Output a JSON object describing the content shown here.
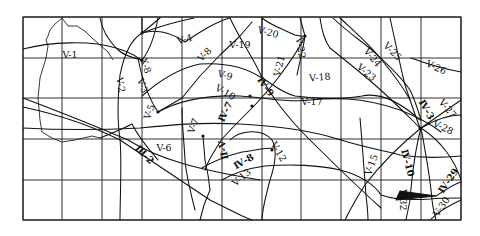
{
  "map": {
    "frame": {
      "x0": 23,
      "y0": 17,
      "x1": 461,
      "y1": 220
    },
    "grid": {
      "vertical_x": [
        23,
        62,
        102,
        142,
        182,
        222,
        262,
        301,
        341,
        381,
        421,
        461
      ],
      "horizontal_y": [
        17,
        58,
        98,
        139,
        180,
        220
      ]
    },
    "colors": {
      "ink": "#111111",
      "background": "#ffffff"
    },
    "labels": [
      {
        "id": "V-1",
        "text": "V-1",
        "x": 70,
        "y": 55,
        "rot": 0
      },
      {
        "id": "V-2",
        "text": "V-2",
        "x": 120,
        "y": 85,
        "rot": 80
      },
      {
        "id": "V-3",
        "text": "V-3",
        "x": 142,
        "y": 86,
        "rot": 70
      },
      {
        "id": "X-8",
        "text": "X-8",
        "x": 145,
        "y": 66,
        "rot": 70
      },
      {
        "id": "V-5",
        "text": "V-5",
        "x": 150,
        "y": 112,
        "rot": -70
      },
      {
        "id": "V-4",
        "text": "V-4",
        "x": 185,
        "y": 40,
        "rot": -15
      },
      {
        "id": "V-8",
        "text": "V-8",
        "x": 205,
        "y": 55,
        "rot": -45
      },
      {
        "id": "V-19",
        "text": "V-19",
        "x": 240,
        "y": 45,
        "rot": 0
      },
      {
        "id": "V-20",
        "text": "V-20",
        "x": 268,
        "y": 33,
        "rot": 15
      },
      {
        "id": "V-22",
        "text": "V-22",
        "x": 300,
        "y": 48,
        "rot": 80
      },
      {
        "id": "V-21",
        "text": "V-21",
        "x": 280,
        "y": 66,
        "rot": -75
      },
      {
        "id": "V-9",
        "text": "V-9",
        "x": 225,
        "y": 76,
        "rot": 15
      },
      {
        "id": "IV-9",
        "text": "Ⅳ-9",
        "x": 265,
        "y": 87,
        "rot": 55
      },
      {
        "id": "V-10",
        "text": "V-10",
        "x": 225,
        "y": 93,
        "rot": 30
      },
      {
        "id": "IV-7",
        "text": "Ⅳ-7",
        "x": 226,
        "y": 112,
        "rot": -65
      },
      {
        "id": "V-7",
        "text": "V-7",
        "x": 194,
        "y": 126,
        "rot": -70
      },
      {
        "id": "V-6",
        "text": "V-6",
        "x": 164,
        "y": 148,
        "rot": 0
      },
      {
        "id": "III-2",
        "text": "Ⅲ-2",
        "x": 144,
        "y": 155,
        "rot": 45
      },
      {
        "id": "II-V",
        "text": "Ⅱ-Ⅴ",
        "x": 224,
        "y": 150,
        "rot": -100
      },
      {
        "id": "IV-8",
        "text": "Ⅳ-8",
        "x": 244,
        "y": 162,
        "rot": -30
      },
      {
        "id": "V-12",
        "text": "V-12",
        "x": 278,
        "y": 152,
        "rot": 60
      },
      {
        "id": "V-13",
        "text": "V-13",
        "x": 242,
        "y": 178,
        "rot": -40
      },
      {
        "id": "V-18",
        "text": "V-18",
        "x": 320,
        "y": 78,
        "rot": -5
      },
      {
        "id": "V-17",
        "text": "V-17",
        "x": 312,
        "y": 102,
        "rot": 0
      },
      {
        "id": "V-24",
        "text": "V-24",
        "x": 372,
        "y": 58,
        "rot": 50
      },
      {
        "id": "V-25",
        "text": "V-25",
        "x": 392,
        "y": 52,
        "rot": 45
      },
      {
        "id": "V-23",
        "text": "V-23",
        "x": 366,
        "y": 73,
        "rot": 40
      },
      {
        "id": "V-26",
        "text": "V-26",
        "x": 436,
        "y": 68,
        "rot": 25
      },
      {
        "id": "V-27",
        "text": "V-27",
        "x": 447,
        "y": 109,
        "rot": 50
      },
      {
        "id": "IV-3",
        "text": "Ⅳ-3",
        "x": 426,
        "y": 110,
        "rot": 60
      },
      {
        "id": "V-28",
        "text": "V-28",
        "x": 443,
        "y": 128,
        "rot": 25
      },
      {
        "id": "V-15",
        "text": "V-15",
        "x": 372,
        "y": 165,
        "rot": -70
      },
      {
        "id": "IV-10",
        "text": "Ⅳ-10",
        "x": 407,
        "y": 163,
        "rot": 75
      },
      {
        "id": "IV-29",
        "text": "Ⅳ-29",
        "x": 449,
        "y": 181,
        "rot": -55
      },
      {
        "id": "V-32",
        "text": "V-32",
        "x": 402,
        "y": 200,
        "rot": 90
      },
      {
        "id": "V-30",
        "text": "V-30",
        "x": 442,
        "y": 207,
        "rot": -55
      }
    ],
    "outline_paths": [
      "M62,18 L68,26 L77,26 L86,32 L92,38 L100,45 L108,52 L113,60",
      "M62,18 L55,24 L50,30 L48,36 L46,40 L48,46 L46,58 L40,78 L38,98 L40,120 L42,132 L52,138 L62,142 L75,140 L92,136 L100,138"
    ],
    "fault_paths": [
      "M23,49 C50,42 90,40 116,48 C130,52 140,58 142,62",
      "M100,18 C102,30 108,40 118,50 C125,56 133,58 142,60 C150,50 155,35 158,18",
      "M142,18 L142,33 L160,18",
      "M142,33 C160,28 175,35 185,42 C200,32 215,22 230,18",
      "M142,33 C155,28 175,22 194,18",
      "M142,33 C130,40 124,55 120,75 C118,95 117,120 120,139 C122,160 120,200 120,220",
      "M138,58 C142,80 150,100 158,112",
      "M158,112 C180,100 210,95 240,96 C270,98 290,103 310,100 C330,98 360,96 400,110 C420,118 432,125 441,132",
      "M142,96 C160,80 180,68 200,64 C230,62 250,70 262,78 C270,82 280,92 295,96 C310,98 340,100 362,96 C380,92 400,102 420,120",
      "M23,98 C60,112 100,128 128,140 C160,160 200,170 260,180",
      "M23,107 C60,115 90,125 120,140 C150,160 180,180 210,200 C230,210 245,218 252,220",
      "M158,112 L182,98 L200,76 L220,55 L240,36 L252,22",
      "M230,18 C240,40 255,60 262,78 C270,95 290,120 305,135 C330,160 350,180 381,208",
      "M262,18 C270,25 285,30 295,35 C300,36 303,37 305,36 C303,50 300,60 297,75",
      "M305,36 C300,48 290,62 278,78 C270,88 262,98 252,108 C240,120 230,130 222,139 C215,150 208,160 205,170",
      "M182,108 C182,125 184,140 185,160 C186,175 190,190 195,210",
      "M203,136 L205,160 L208,175 L210,190 L204,205 L200,220",
      "M202,168 C215,160 230,155 242,152 C256,150 265,148 275,148",
      "M230,140 C240,130 262,128 272,140 C278,150 275,165 270,180 C266,195 262,210 262,220",
      "M222,180 C236,172 250,168 265,166 C290,164 320,165 340,170 C360,175 375,185 381,195 C395,200 415,200 430,199 C440,198 450,198 461,198",
      "M100,138 C115,132 125,128 132,124 C140,140 150,150 158,160",
      "M320,18 C322,30 324,40 330,48 C345,60 360,72 375,85 C390,98 402,110 412,120 L420,128",
      "M333,18 C345,30 360,40 372,50 C385,62 400,75 410,90 C415,100 418,110 421,120",
      "M340,18 C355,32 370,45 380,58 C390,70 402,85 410,100",
      "M390,18 C395,40 400,65 405,85 C410,100 415,115 420,128",
      "M411,58 C430,65 450,70 461,72",
      "M421,128 L461,100",
      "M421,128 C435,120 448,115 461,115",
      "M421,128 C440,140 455,160 461,180",
      "M421,128 C415,150 412,175 410,200 C408,210 407,215 406,220",
      "M421,128 C425,150 430,175 432,200 C433,210 435,215 436,220",
      "M421,128 C400,145 380,165 365,185 C355,200 350,210 345,220",
      "M360,118 C362,140 364,170 366,195 C367,205 368,212 368,220",
      "M396,200 L436,196 L400,191 Z",
      "M436,196 C445,190 452,185 461,182",
      "M430,220 C440,210 450,205 461,200",
      "M23,128 C60,130 100,130 140,128 C170,125 200,122 240,124 C280,126 310,130 341,140 C360,146 380,150 400,155 C420,158 440,158 461,156",
      "M262,18 L262,80",
      "M305,36 L300,18"
    ],
    "nodes": [
      [
        142,
        33
      ],
      [
        142,
        60
      ],
      [
        158,
        112
      ],
      [
        252,
        106
      ],
      [
        203,
        136
      ],
      [
        420,
        128
      ],
      [
        305,
        36
      ],
      [
        250,
        96
      ],
      [
        272,
        150
      ]
    ]
  }
}
